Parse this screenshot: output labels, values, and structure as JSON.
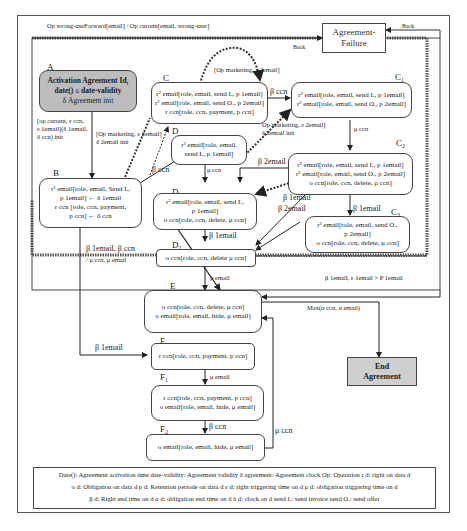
{
  "top_label": "Op wrong-useForward[email] / Op current[email, wrong-user]",
  "failure_box": {
    "line1": "Agreement-",
    "line2": "Failure"
  },
  "back_labels": {
    "top": "Back",
    "right": "Back"
  },
  "end_box": {
    "line1": "End",
    "line2": "Agreement"
  },
  "states": {
    "A": {
      "tag": "A",
      "lines": [
        "Activation Agreement Id,",
        "date() ≤ date-validity",
        "δ Agreement init"
      ]
    },
    "B": {
      "tag": "B",
      "lines": [
        "r² email[role, email, Send I.,",
        "p 1email] ← δ 1email",
        "r ccn [role, ccn, payment,",
        "p ccn] ← δ ccn"
      ]
    },
    "C": {
      "tag": "C",
      "lines": [
        "r² email[role, email, send I., p 1email]",
        "r² email[role, email, send O., p 2email]",
        "r ccn[role, ccn, payment, p ccn]"
      ]
    },
    "C1": {
      "tag": "C₁",
      "lines": [
        "r² email[role, email, send I., p 1email]",
        "r² email[role, email, send O., p 2email]"
      ]
    },
    "C2": {
      "tag": "C₂",
      "lines": [
        "r² email[role, email, send I., p 1email]",
        "r² email[role, email, send O., p 2email]",
        "o ccn[role, ccn, delete, μ ccn]"
      ]
    },
    "C3": {
      "tag": "C₃",
      "lines": [
        "r² email[role, email, send O.,",
        "p 2email]",
        "o ccn[role, ccn, delete, μ ccn]"
      ]
    },
    "D": {
      "tag": "D",
      "lines": [
        "r² email[role, email,",
        "send I., p 1email]"
      ]
    },
    "D1": {
      "tag": "D₁",
      "lines": [
        "r² email[role, email, send I.,",
        "p 1email]",
        "o ccn[role, ccn, delete, μ ccn]"
      ]
    },
    "D2": {
      "tag": "D₂",
      "lines": [
        "o ccn[role, ccn, delete μ ccn]"
      ]
    },
    "E": {
      "tag": "E",
      "lines": [
        "o ccn[role, ccn, delete, μ ccn]",
        "o email[role, email, hide, μ email]"
      ]
    },
    "F": {
      "tag": "F",
      "lines": [
        "r ccn[role, ccn, payment, p ccn]"
      ]
    },
    "F1": {
      "tag": "F₁",
      "lines": [
        "r ccn[role, ccn, payment, p ccn]",
        "o email[role, email, hide, μ email]"
      ]
    },
    "F2": {
      "tag": "F₂",
      "lines": [
        "o email[role, email, hide, μ email]"
      ]
    }
  },
  "transitions": {
    "A_B": [
      "[op current, ε ccn,",
      "ε 1email](δ 1email,",
      "δ ccn) init"
    ],
    "A_D": [
      "[Op marketing, ε 2email]",
      "δ 2email init"
    ],
    "C_loop": "[Op marketing, ε 2email]",
    "C_C1": "β ccn",
    "D_C1": [
      "Op marketing, ε 2email]",
      "δ 2email init"
    ],
    "B_C": "β ccn",
    "C1_C2": "μ ccn",
    "D_D1": "μ ccn",
    "C2_D1": "β 2email",
    "C2_D2": "β 1email",
    "C3_D2": "β 2email",
    "C2_C3": "β 1email",
    "D1_D2": "β 1email",
    "B_E": [
      "β 1email, β ccn",
      "/ μ ccn, μ email"
    ],
    "D2_E": "μ email",
    "group_E": "β 1email, ε 1email > P 1email",
    "E_End": "Max(α ccn, α email)",
    "B_F": "β 1email",
    "F_F1": "μ email",
    "F1_F2": "β ccn",
    "F2_E": "μ ccn"
  },
  "legend": {
    "row1": "Date(): Agreement activation time   date-validity: Agreement validity   δ agreement: Agreement clock   Op: Operation   r d: right on data d",
    "row2": "o d: Obligation on data d   p d: Retention periode on data d   ε d: right triggering time on d   μ d: obligation triggering time on d",
    "row3": "β d: Right end time on d   α d: obligation end time on d   δ d: clock on d   send I.: send invoice   send O.: send offer"
  },
  "colors": {
    "shaded": "#bdbdbd",
    "end_fill": "#cfcfcf",
    "line": "#333333"
  }
}
